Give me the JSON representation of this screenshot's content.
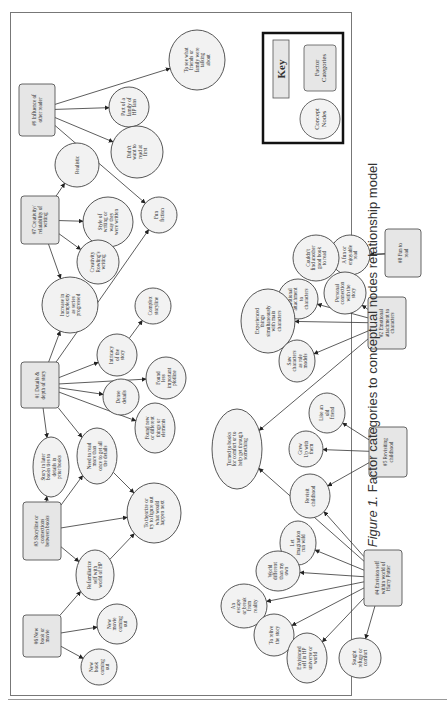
{
  "figure": {
    "caption_label": "Figure 1.",
    "caption_text": "Factor categories to conceptual nodes relationship model"
  },
  "key": {
    "title": "Key",
    "factor_label": [
      "Factor",
      "Categories"
    ],
    "concept_label": [
      "Concept",
      "Nodes"
    ]
  },
  "factors": [
    {
      "id": "f1",
      "label": [
        "#1 Details &",
        "depth of story"
      ]
    },
    {
      "id": "f2",
      "label": [
        "#2 Emotional",
        "attachment to",
        "characters"
      ]
    },
    {
      "id": "f3",
      "label": [
        "#3 Storyline or",
        "connections",
        "between books"
      ]
    },
    {
      "id": "f4",
      "label": [
        "#4 Envision self",
        "within world of",
        "Harry Potter"
      ]
    },
    {
      "id": "f5",
      "label": [
        "#5 Revisiting",
        "childhood"
      ]
    },
    {
      "id": "f6",
      "label": [
        "#6 New",
        "book or",
        "movie"
      ]
    },
    {
      "id": "f7",
      "label": [
        "#7 Creativity/",
        "relatability of",
        "writing"
      ]
    },
    {
      "id": "f8",
      "label": [
        "#8 Fun to",
        "read"
      ]
    },
    {
      "id": "f9",
      "label": [
        "#9 Influence of",
        "other reader"
      ]
    }
  ],
  "concepts": [
    {
      "id": "c_see_friends",
      "label": [
        "To see what",
        "friends or",
        "family were",
        "talking",
        "about"
      ]
    },
    {
      "id": "c_part_family",
      "label": [
        "Part of a",
        "family of",
        "HP fans"
      ]
    },
    {
      "id": "c_didnt_want",
      "label": [
        "Didn't",
        "want to",
        "read at",
        "first"
      ]
    },
    {
      "id": "c_realistic",
      "label": [
        "Realistic"
      ]
    },
    {
      "id": "c_style",
      "label": [
        "Style of",
        "writing or",
        "way they",
        "were written"
      ]
    },
    {
      "id": "c_creativity",
      "label": [
        "Creativity",
        "Rowling's",
        "writing"
      ]
    },
    {
      "id": "c_fun_fiction",
      "label": [
        "Fun",
        "fiction"
      ]
    },
    {
      "id": "c_increase",
      "label": [
        "Increase in",
        "complexity",
        "as series",
        "progressed"
      ]
    },
    {
      "id": "c_complex",
      "label": [
        "Complex",
        "storyline"
      ]
    },
    {
      "id": "c_intricacy",
      "label": [
        "Intricacy",
        "of the",
        "story"
      ]
    },
    {
      "id": "c_found_less",
      "label": [
        "Found",
        "less",
        "important",
        "plotline"
      ]
    },
    {
      "id": "c_dense",
      "label": [
        "Dense",
        "details"
      ]
    },
    {
      "id": "c_found_new",
      "label": [
        "Found new",
        "or different",
        "things or",
        "elements"
      ]
    },
    {
      "id": "c_story_later",
      "label": [
        "Story in later",
        "books ties to",
        "details in",
        "prior books"
      ]
    },
    {
      "id": "c_need_reread",
      "label": [
        "Need to read",
        "more than",
        "once to get all",
        "the details"
      ]
    },
    {
      "id": "c_theorize",
      "label": [
        "To theorize or",
        "try to figure out",
        "what would",
        "happen next"
      ]
    },
    {
      "id": "c_refamiliarize",
      "label": [
        "Refamiliarize",
        "self with",
        "world of HP"
      ]
    },
    {
      "id": "c_new_movie",
      "label": [
        "New",
        "movie",
        "coming",
        "out"
      ]
    },
    {
      "id": "c_new_book",
      "label": [
        "New",
        "book",
        "coming",
        "out"
      ]
    },
    {
      "id": "c_fun_enjoyable",
      "label": [
        "A fun or",
        "enjoyable",
        "read"
      ]
    },
    {
      "id": "c_couldnt_find",
      "label": [
        "Couldn't",
        "find another",
        "good book",
        "to read"
      ]
    },
    {
      "id": "c_personal",
      "label": [
        "Personal",
        "connection",
        "with the",
        "story"
      ]
    },
    {
      "id": "c_emotional",
      "label": [
        "Emotional",
        "attachment",
        "to",
        "characters"
      ]
    },
    {
      "id": "c_experienced",
      "label": [
        "Experienced",
        "things",
        "simultaneously",
        "with main",
        "characters"
      ]
    },
    {
      "id": "c_role_models",
      "label": [
        "Saw",
        "characters",
        "as role",
        "models"
      ]
    },
    {
      "id": "c_turned",
      "label": [
        "Turned to books",
        "for comfort or to",
        "help get through",
        "something"
      ]
    },
    {
      "id": "c_old_friend",
      "label": [
        "Like an",
        "old",
        "friend"
      ]
    },
    {
      "id": "c_grew_up",
      "label": [
        "Grew",
        "Up with",
        "them"
      ]
    },
    {
      "id": "c_revisit",
      "label": [
        "Revisit",
        "childhood"
      ]
    },
    {
      "id": "c_imagination",
      "label": [
        "Let",
        "imagination",
        "run wild"
      ]
    },
    {
      "id": "c_world_diff",
      "label": [
        "World",
        "different",
        "than my",
        "own"
      ]
    },
    {
      "id": "c_escape",
      "label": [
        "An",
        "escape",
        "or break",
        "from",
        "reality"
      ]
    },
    {
      "id": "c_relive",
      "label": [
        "To relive",
        "the story"
      ]
    },
    {
      "id": "c_envisioned",
      "label": [
        "Envisioned",
        "self in HP",
        "universe or",
        "world"
      ]
    },
    {
      "id": "c_refuge",
      "label": [
        "Sought",
        "refuge or",
        "comfort"
      ]
    }
  ],
  "edges": [
    [
      "f9",
      "c_see_friends"
    ],
    [
      "f9",
      "c_part_family"
    ],
    [
      "f9",
      "c_didnt_want"
    ],
    [
      "f9",
      "c_fun_fiction"
    ],
    [
      "f7",
      "c_realistic"
    ],
    [
      "f7",
      "c_style"
    ],
    [
      "f7",
      "c_creativity"
    ],
    [
      "f7",
      "c_increase"
    ],
    [
      "f1",
      "c_increase"
    ],
    [
      "f1",
      "c_fun_fiction"
    ],
    [
      "f1",
      "c_intricacy"
    ],
    [
      "f1",
      "c_found_less"
    ],
    [
      "f1",
      "c_dense"
    ],
    [
      "f1",
      "c_found_new"
    ],
    [
      "f1",
      "c_story_later"
    ],
    [
      "f1",
      "c_need_reread"
    ],
    [
      "c_intricacy",
      "c_complex"
    ],
    [
      "f3",
      "c_story_later"
    ],
    [
      "f3",
      "c_need_reread"
    ],
    [
      "f3",
      "c_theorize"
    ],
    [
      "f3",
      "c_refamiliarize"
    ],
    [
      "c_need_reread",
      "c_theorize"
    ],
    [
      "c_refamiliarize",
      "c_theorize"
    ],
    [
      "f6",
      "c_refamiliarize"
    ],
    [
      "f6",
      "c_new_movie"
    ],
    [
      "f6",
      "c_new_book"
    ],
    [
      "f8",
      "c_fun_enjoyable"
    ],
    [
      "f8",
      "c_couldnt_find"
    ],
    [
      "f2",
      "c_personal"
    ],
    [
      "f2",
      "c_emotional"
    ],
    [
      "f2",
      "c_experienced"
    ],
    [
      "f2",
      "c_role_models"
    ],
    [
      "f2",
      "c_turned"
    ],
    [
      "f5",
      "c_old_friend"
    ],
    [
      "f5",
      "c_grew_up"
    ],
    [
      "f5",
      "c_revisit"
    ],
    [
      "f4",
      "c_revisit"
    ],
    [
      "f4",
      "c_turned"
    ],
    [
      "f4",
      "c_imagination"
    ],
    [
      "f4",
      "c_world_diff"
    ],
    [
      "f4",
      "c_escape"
    ],
    [
      "f4",
      "c_relive"
    ],
    [
      "f4",
      "c_envisioned"
    ],
    [
      "f4",
      "c_refuge"
    ]
  ]
}
